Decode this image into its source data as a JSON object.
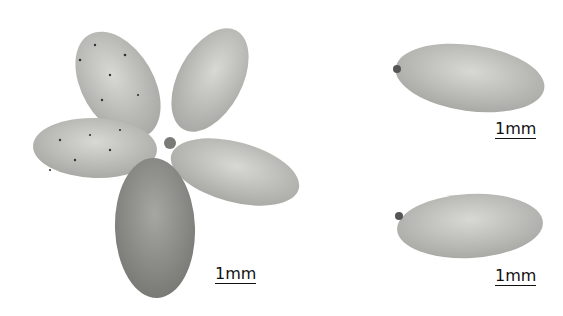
{
  "image": {
    "description": "Photograph of flower petals: a five-petaled corolla on the left and two separate single petals on the right, each with a scale bar",
    "colors": {
      "background": "#ffffff",
      "petal": "#c9c9c6",
      "petal_dark": "#8e8e8a",
      "dots": "#333333"
    }
  },
  "labels": {
    "scale_main": "1mm",
    "scale_top_right": "1mm",
    "scale_bottom_right": "1mm"
  }
}
